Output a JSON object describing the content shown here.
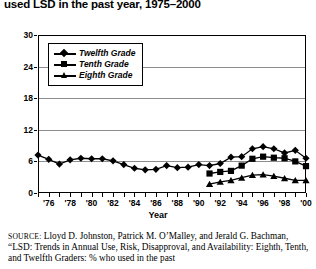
{
  "title": "used LSD in the past year, 1975–2000",
  "axes": {
    "xlabel": "Year",
    "ylabel": "",
    "yticks": [
      "0",
      "6",
      "12",
      "18",
      "24",
      "30"
    ],
    "xticks": [
      "'76",
      "'78",
      "'80",
      "'82",
      "'84",
      "'86",
      "'88",
      "'90",
      "'92",
      "'94",
      "'96",
      "'98",
      "'00"
    ]
  },
  "legend": {
    "items": [
      {
        "label": "Twelfth Grade",
        "marker": "diamond-marker"
      },
      {
        "label": "Tenth Grade",
        "marker": "square-marker"
      },
      {
        "label": "Eighth Grade",
        "marker": "triangle-marker"
      }
    ]
  },
  "source": {
    "prefix": "SOURCE:",
    "text": " Lloyd D. Johnston, Patrick M. O’Malley, and Jerald G. Bachman, “LSD: Trends in Annual Use, Risk, Disapproval, and Availability: Eighth, Tenth, and Twelfth Graders: % who used in the past"
  },
  "chart_data": {
    "type": "line",
    "title": "used LSD in the past year, 1975–2000",
    "xlabel": "Year",
    "ylabel": "",
    "xlim": [
      1975,
      2000
    ],
    "ylim": [
      0,
      30
    ],
    "yticks": [
      0,
      6,
      12,
      18,
      24,
      30
    ],
    "grid": true,
    "legend_position": "upper-left-inset",
    "x": [
      1975,
      1976,
      1977,
      1978,
      1979,
      1980,
      1981,
      1982,
      1983,
      1984,
      1985,
      1986,
      1987,
      1988,
      1989,
      1990,
      1991,
      1992,
      1993,
      1994,
      1995,
      1996,
      1997,
      1998,
      1999,
      2000
    ],
    "series": [
      {
        "name": "Twelfth Grade",
        "marker": "diamond",
        "x": [
          1975,
          1976,
          1977,
          1978,
          1979,
          1980,
          1981,
          1982,
          1983,
          1984,
          1985,
          1986,
          1987,
          1988,
          1989,
          1990,
          1991,
          1992,
          1993,
          1994,
          1995,
          1996,
          1997,
          1998,
          1999,
          2000
        ],
        "values": [
          7.2,
          6.4,
          5.5,
          6.3,
          6.6,
          6.5,
          6.5,
          6.1,
          5.4,
          4.7,
          4.4,
          4.5,
          5.2,
          4.8,
          4.9,
          5.4,
          5.2,
          5.6,
          6.8,
          6.9,
          8.4,
          8.8,
          8.4,
          7.6,
          8.1,
          6.6
        ]
      },
      {
        "name": "Tenth Grade",
        "marker": "square",
        "x": [
          1991,
          1992,
          1993,
          1994,
          1995,
          1996,
          1997,
          1998,
          1999,
          2000
        ],
        "values": [
          3.7,
          4.0,
          4.2,
          5.2,
          6.5,
          6.9,
          6.7,
          6.6,
          6.0,
          5.1
        ]
      },
      {
        "name": "Eighth Grade",
        "marker": "triangle",
        "x": [
          1991,
          1992,
          1993,
          1994,
          1995,
          1996,
          1997,
          1998,
          1999,
          2000
        ],
        "values": [
          1.7,
          2.1,
          2.4,
          2.9,
          3.4,
          3.5,
          3.2,
          2.8,
          2.4,
          2.4
        ]
      }
    ]
  }
}
